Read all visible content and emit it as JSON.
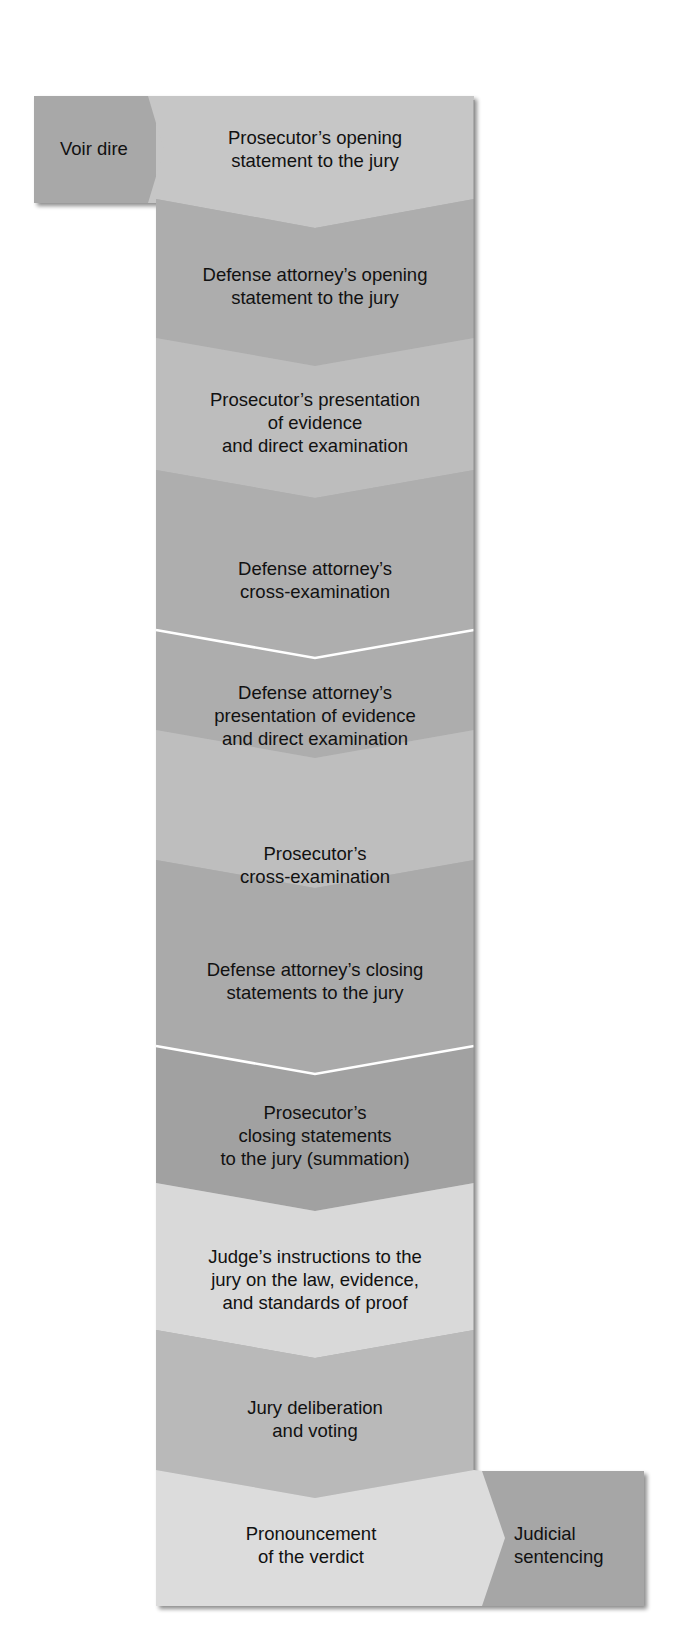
{
  "diagram": {
    "type": "vertical-chevron-flowchart",
    "topic": "Sequence of a criminal jury trial",
    "colors": {
      "background": "#ffffff",
      "text": "#111111",
      "divider": "#ffffff",
      "shadow": "#8a8a8a"
    },
    "entry_step": {
      "label": "Voir dire",
      "color": "#a8a8a8"
    },
    "steps": [
      {
        "id": 1,
        "label": "Prosecutor’s opening\nstatement to the jury",
        "color": "#c6c6c6"
      },
      {
        "id": 2,
        "label": "Defense attorney’s opening\nstatement to the jury",
        "color": "#adadad"
      },
      {
        "id": 3,
        "label": "Prosecutor’s presentation\nof evidence\nand direct examination",
        "color": "#bdbdbd"
      },
      {
        "id": 4,
        "label": "Defense attorney’s\ncross-examination",
        "color": "#aeaeae"
      },
      {
        "id": 5,
        "label": "Defense attorney’s\npresentation of evidence\nand direct examination",
        "color": "#adadad"
      },
      {
        "id": 6,
        "label": "Prosecutor’s\ncross-examination",
        "color": "#bebebe"
      },
      {
        "id": 7,
        "label": "Defense attorney’s closing\nstatements to the jury",
        "color": "#aaaaaa"
      },
      {
        "id": 8,
        "label": "Prosecutor’s\nclosing statements\nto the jury (summation)",
        "color": "#a1a1a1"
      },
      {
        "id": 9,
        "label": "Judge’s instructions to the\njury on the law, evidence,\nand standards of proof",
        "color": "#d9d9d9"
      },
      {
        "id": 10,
        "label": "Jury deliberation\nand voting",
        "color": "#b9b9b9"
      },
      {
        "id": 11,
        "label": "Pronouncement\nof the verdict",
        "color": "#dcdcdc"
      }
    ],
    "exit_step": {
      "label": "Judicial\nsentencing",
      "color": "#a6a6a6"
    },
    "dividers_after_steps": [
      4,
      7
    ]
  }
}
